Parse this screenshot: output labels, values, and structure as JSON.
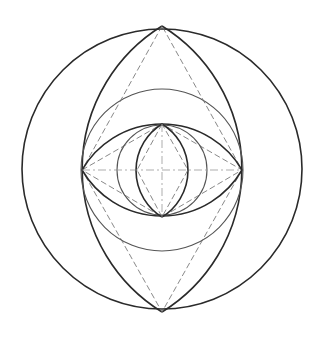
{
  "diagram": {
    "title": "",
    "colors": {
      "background": "#ffffff",
      "stroke_dark": "#2a2a2a",
      "stroke_mid": "#555555",
      "stroke_dash": "#6a6a6a"
    },
    "points": {
      "center": [
        162,
        170
      ],
      "outer_top": [
        162,
        26
      ],
      "outer_bottom": [
        162,
        312
      ],
      "eye_left": [
        82,
        170
      ],
      "eye_right": [
        242,
        170
      ],
      "eye_top": [
        162,
        124
      ],
      "eye_bottom": [
        162,
        217
      ],
      "pupil_left": [
        137,
        170
      ],
      "pupil_right": [
        188,
        170
      ]
    },
    "shapes": [
      {
        "name": "outer-circle",
        "type": "circle",
        "cx": 162,
        "cy": 169,
        "r": 140
      },
      {
        "name": "medium-circle",
        "type": "circle",
        "cx": 162,
        "cy": 170,
        "r": 81
      },
      {
        "name": "iris-circle",
        "type": "circle",
        "cx": 162,
        "cy": 170,
        "r": 45
      },
      {
        "name": "large-vesica",
        "type": "lens",
        "from": [
          162,
          26
        ],
        "to": [
          162,
          312
        ],
        "bulge_to_x": [
          82,
          242
        ]
      },
      {
        "name": "eye-lens",
        "type": "lens",
        "from": [
          82,
          170
        ],
        "to": [
          242,
          170
        ],
        "bulge_to_y": [
          124,
          217
        ]
      },
      {
        "name": "pupil-vesica",
        "type": "lens",
        "from": [
          162,
          124
        ],
        "to": [
          162,
          217
        ],
        "bulge_to_x": [
          137,
          188
        ]
      }
    ],
    "construction_lines": [
      "outer diamond: top-left-bottom-right",
      "eye diamond: eye_left-eye_top-eye_right-eye_bottom",
      "pupil diamond: eye_top-pupil_left-eye_bottom-pupil_right",
      "horizontal center line",
      "vertical center line"
    ]
  }
}
